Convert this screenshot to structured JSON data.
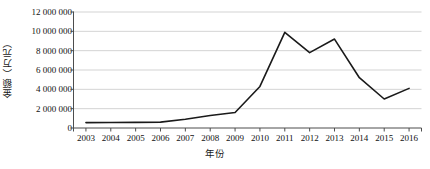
{
  "chart_data": {
    "type": "line",
    "title": "",
    "xlabel": "年份",
    "ylabel": "金额（万元）",
    "categories": [
      "2003",
      "2004",
      "2005",
      "2006",
      "2007",
      "2008",
      "2009",
      "2010",
      "2011",
      "2012",
      "2013",
      "2014",
      "2015",
      "2016"
    ],
    "values": [
      560000,
      570000,
      580000,
      610000,
      900000,
      1300000,
      1600000,
      4300000,
      9900000,
      7800000,
      9200000,
      5200000,
      3000000,
      4100000
    ],
    "series": [
      {
        "name": "金额（万元）",
        "values": [
          560000,
          570000,
          580000,
          610000,
          900000,
          1300000,
          1600000,
          4300000,
          9900000,
          7800000,
          9200000,
          5200000,
          3000000,
          4100000
        ]
      }
    ],
    "ylim": [
      0,
      12000000
    ],
    "ytick_values": [
      0,
      2000000,
      4000000,
      6000000,
      8000000,
      10000000,
      12000000
    ],
    "ytick_labels": [
      "0",
      "2 000 000",
      "4 000 000",
      "6 000 000",
      "8 000 000",
      "10 000 000",
      "12 000 000"
    ],
    "grid": true,
    "grid_axis": "y",
    "legend": "none",
    "line_color": "#1a1a1a",
    "grid_color": "#c8c8c8",
    "axis_color": "#4d4d4d",
    "background": "#ffffff"
  }
}
